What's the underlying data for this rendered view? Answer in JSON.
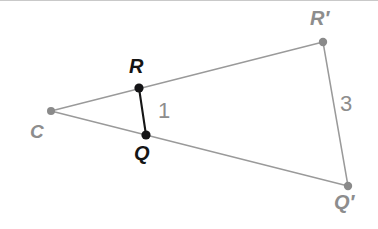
{
  "figure": {
    "canvas": {
      "width": 378,
      "height": 229,
      "background": "#ffffff"
    },
    "colors": {
      "ray_gray": "#9a9a9a",
      "image_segment_gray": "#9a9a9a",
      "preimage_segment_black": "#161616",
      "dot_gray": "#8a8a8a",
      "dot_black": "#141414",
      "label_gray": "#8d8d8d",
      "label_black": "#151515",
      "top_edge": "#c9c9c9"
    },
    "points": [
      {
        "id": "C",
        "label": "C",
        "x": 51,
        "y": 111,
        "dot_color": "#8a8a8a",
        "dot_r": 4.0,
        "label_color": "#8d8d8d",
        "label_x": 30,
        "label_y": 122,
        "font_size": 19
      },
      {
        "id": "R",
        "label": "R",
        "x": 139,
        "y": 88,
        "dot_color": "#141416",
        "dot_r": 4.6,
        "label_color": "#151515",
        "label_x": 129,
        "label_y": 56,
        "font_size": 20
      },
      {
        "id": "Q",
        "label": "Q",
        "x": 146,
        "y": 135,
        "dot_color": "#141416",
        "dot_r": 4.6,
        "label_color": "#151515",
        "label_x": 134,
        "label_y": 143,
        "font_size": 20
      },
      {
        "id": "Rp",
        "label": "R′",
        "x": 323,
        "y": 42,
        "dot_color": "#8a8a8a",
        "dot_r": 4.2,
        "label_color": "#8d8d8d",
        "label_x": 310,
        "label_y": 8,
        "font_size": 20
      },
      {
        "id": "Qp",
        "label": "Q′",
        "x": 348,
        "y": 186,
        "dot_color": "#8a8a8a",
        "dot_r": 4.2,
        "label_color": "#8d8d8d",
        "label_x": 334,
        "label_y": 192,
        "font_size": 20
      }
    ],
    "segments": [
      {
        "id": "ray-c-rprime",
        "from": "C",
        "to": "Rp",
        "color": "#9a9a9a",
        "width": 1.3,
        "style": "ray"
      },
      {
        "id": "ray-c-qprime",
        "from": "C",
        "to": "Qp",
        "color": "#9a9a9a",
        "width": 1.3,
        "style": "ray"
      },
      {
        "id": "seg-r-q",
        "from": "R",
        "to": "Q",
        "color": "#161616",
        "width": 2.1,
        "style": "preimage"
      },
      {
        "id": "seg-rprime-qprime",
        "from": "Rp",
        "to": "Qp",
        "color": "#9a9a9a",
        "width": 1.5,
        "style": "image"
      }
    ],
    "measures": [
      {
        "id": "length-rq",
        "text": "1",
        "x": 158,
        "y": 100,
        "font_size": 22,
        "color": "#8d8d8d"
      },
      {
        "id": "length-rprimeqprime",
        "text": "3",
        "x": 340,
        "y": 93,
        "font_size": 22,
        "color": "#8d8d8d"
      }
    ]
  }
}
